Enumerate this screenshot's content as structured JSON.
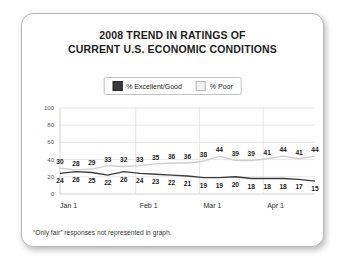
{
  "chart_data": {
    "type": "line",
    "title": "2008 TREND IN RATINGS OF CURRENT U.S. ECONOMIC CONDITIONS",
    "title_lines": [
      "2008 TREND IN RATINGS OF",
      "CURRENT U.S. ECONOMIC CONDITIONS"
    ],
    "xlabel": "",
    "ylabel": "",
    "ylim": [
      0,
      100
    ],
    "yticks": [
      0,
      20,
      40,
      60,
      80,
      100
    ],
    "grid": true,
    "legend_position": "top-center",
    "x_tick_labels": [
      "Jan 1",
      "Feb 1",
      "Mar 1",
      "Apr 1"
    ],
    "x_tick_indices": [
      0,
      5,
      9,
      13
    ],
    "n_points": 17,
    "series": [
      {
        "name": "% Poor",
        "color": "#cfcfcf",
        "values": [
          30,
          28,
          29,
          33,
          32,
          33,
          35,
          36,
          36,
          38,
          44,
          39,
          39,
          41,
          44,
          41,
          44
        ]
      },
      {
        "name": "% Excellent/Good",
        "color": "#3c3c3c",
        "values": [
          24,
          26,
          25,
          22,
          26,
          24,
          23,
          22,
          21,
          19,
          19,
          20,
          18,
          18,
          18,
          17,
          15
        ]
      }
    ],
    "footnote": "“Only fair” responses not represented in graph."
  },
  "legend": {
    "entries": [
      {
        "label": "% Excellent/Good",
        "swatch": "dark"
      },
      {
        "label": "% Poor",
        "swatch": "light"
      }
    ]
  },
  "colors": {
    "card_background": "#ffffff",
    "card_border": "#b9b9b9",
    "excellent_good": "#3c3c3c",
    "poor": "#cfcfcf",
    "gridline": "#dedede",
    "text": "#1d1d1d"
  }
}
